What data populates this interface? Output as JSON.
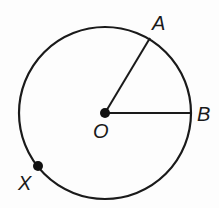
{
  "diagram": {
    "type": "circle-with-radii",
    "center": {
      "label": "O",
      "x": 105,
      "y": 113
    },
    "radius": 86,
    "points": [
      {
        "label": "A",
        "x": 150,
        "y": 38,
        "label_x": 152,
        "label_y": 30
      },
      {
        "label": "B",
        "x": 191,
        "y": 113,
        "label_x": 197,
        "label_y": 121
      },
      {
        "label": "X",
        "x": 38,
        "y": 166,
        "label_x": 18,
        "label_y": 190
      }
    ],
    "segments": [
      [
        "O",
        "A"
      ],
      [
        "O",
        "B"
      ]
    ],
    "dots": [
      "O",
      "X"
    ],
    "colors": {
      "stroke": "#1a1a1a",
      "background": "#fdfdfd"
    }
  }
}
